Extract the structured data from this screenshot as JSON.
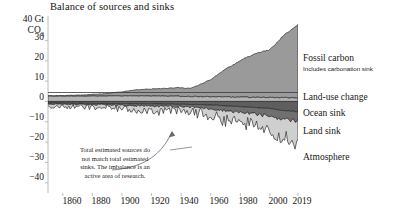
{
  "chart_data": {
    "type": "area",
    "title": "Balance of sources and sinks",
    "xlabel": "",
    "ylabel": "40 Gt CO2",
    "ylim": [
      -45,
      42
    ],
    "xlim": [
      1850,
      2019
    ],
    "grid": false,
    "legend_position": "right",
    "y_unit_top": "40 Gt",
    "y_unit_co2": "CO",
    "y_unit_co2_sub": "2",
    "yticks": [
      30,
      20,
      10,
      0,
      -10,
      -20,
      -30,
      -40
    ],
    "ytick_labels": [
      "30",
      "20",
      "10",
      "0",
      "−10",
      "−20",
      "−30",
      "−40"
    ],
    "xticks": [
      1860,
      1880,
      1900,
      1920,
      1940,
      1960,
      1980,
      2000,
      2019
    ],
    "xtick_labels": [
      "1860",
      "1880",
      "1900",
      "1920",
      "1940",
      "1960",
      "1980",
      "2000",
      "2019"
    ],
    "series": [
      {
        "name": "Fossil carbon",
        "sublabel": "Includes carbonation sink",
        "color": "#9a9a9a",
        "direction": "positive",
        "x": [
          1850,
          1860,
          1870,
          1880,
          1890,
          1900,
          1910,
          1920,
          1930,
          1940,
          1945,
          1950,
          1960,
          1970,
          1980,
          1990,
          2000,
          2010,
          2019
        ],
        "values": [
          0.2,
          0.3,
          0.5,
          0.8,
          1.2,
          2.0,
          3.0,
          3.4,
          3.8,
          4.3,
          3.9,
          5.0,
          8.5,
          13.5,
          18.0,
          21.5,
          23.5,
          31.0,
          36.0
        ]
      },
      {
        "name": "Land-use change",
        "color": "#b4b4b4",
        "direction": "positive",
        "x": [
          1850,
          1870,
          1890,
          1910,
          1930,
          1950,
          1960,
          1970,
          1980,
          1990,
          2000,
          2010,
          2019
        ],
        "values": [
          2.6,
          2.6,
          2.7,
          2.7,
          2.6,
          2.4,
          2.3,
          2.2,
          2.1,
          2.0,
          1.9,
          1.8,
          1.8
        ]
      },
      {
        "name": "Ocean sink",
        "color": "#5e5e5e",
        "direction": "negative",
        "x": [
          1850,
          1870,
          1890,
          1910,
          1930,
          1950,
          1960,
          1970,
          1980,
          1990,
          2000,
          2010,
          2019
        ],
        "values": [
          -0.8,
          -0.9,
          -1.0,
          -1.2,
          -1.3,
          -1.5,
          -1.8,
          -2.2,
          -2.6,
          -3.0,
          -3.5,
          -4.5,
          -5.0
        ]
      },
      {
        "name": "Land sink",
        "color": "#707070",
        "direction": "negative",
        "x": [
          1850,
          1870,
          1890,
          1910,
          1930,
          1950,
          1960,
          1970,
          1980,
          1990,
          2000,
          2010,
          2019
        ],
        "values": [
          -0.5,
          -0.6,
          -0.7,
          -0.9,
          -1.1,
          -1.4,
          -1.8,
          -2.3,
          -2.8,
          -3.2,
          -3.8,
          -4.3,
          -4.6
        ]
      },
      {
        "name": "Atmosphere",
        "color": "#cfcfcf",
        "direction": "negative",
        "x": [
          1850,
          1870,
          1890,
          1910,
          1930,
          1950,
          1960,
          1970,
          1980,
          1990,
          2000,
          2010,
          2019
        ],
        "values": [
          -1.2,
          -1.3,
          -1.5,
          -1.8,
          -2.2,
          -2.6,
          -3.2,
          -4.2,
          -5.0,
          -6.0,
          -6.5,
          -8.5,
          -10.0
        ]
      }
    ],
    "annotations": [
      {
        "name": "imbalance-note",
        "text": "Total estimated sources do not match total estimated sinks. The imbalance is an active area of research.",
        "lines": [
          "Total estimated sources do",
          "not match total estimated",
          "sinks. The imbalance is an",
          "active area of research."
        ]
      }
    ]
  },
  "legend": {
    "fossil_carbon": "Fossil carbon",
    "fossil_carbon_sub": "Includes carbonation sink",
    "land_use_change": "Land-use change",
    "ocean_sink": "Ocean sink",
    "land_sink": "Land sink",
    "atmosphere": "Atmosphere"
  },
  "colors": {
    "fossil_carbon": "#9a9a9a",
    "land_use_change": "#b4b4b4",
    "ocean_sink": "#5e5e5e",
    "land_sink": "#707070",
    "atmosphere": "#cfcfcf",
    "axis": "#b8b8b8",
    "text": "#161616"
  }
}
